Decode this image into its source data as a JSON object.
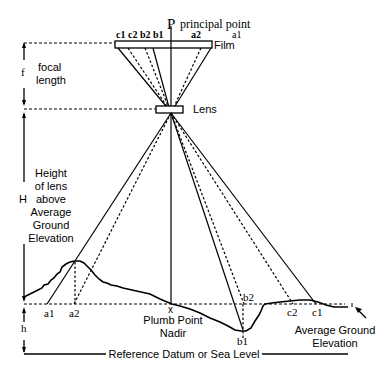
{
  "diagram": {
    "labels": {
      "principal_point_letter": "P",
      "principal_point": "principal point",
      "film": "Film",
      "lens": "Lens",
      "f": "f",
      "focal_length_1": "focal",
      "focal_length_2": "length",
      "H": "H",
      "height_1": "Height",
      "height_2": "of lens",
      "height_3": "above",
      "height_4": "Average",
      "height_5": "Ground",
      "height_6": "Elevation",
      "h": "h",
      "plumb_x": "x",
      "plumb_1": "Plumb Point",
      "plumb_2": "Nadir",
      "avg_ground_1": "Average Ground",
      "avg_ground_2": "Elevation",
      "datum": "Reference Datum or Sea Level"
    },
    "film_points": [
      "c1",
      "c2",
      "b2",
      "b1",
      "a2",
      "a1"
    ],
    "ground_points": [
      "a1",
      "a2",
      "b2",
      "b1",
      "c2",
      "c1"
    ]
  }
}
